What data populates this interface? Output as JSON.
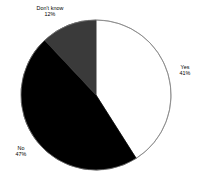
{
  "chart_data": {
    "type": "pie",
    "title": "",
    "subtitle": "",
    "xlabel": "",
    "ylabel": "",
    "legend_position": "none",
    "grid": false,
    "labels_outside": true,
    "start_angle_deg": 0,
    "direction": "clockwise",
    "categories": [
      "Yes",
      "No",
      "Don't know"
    ],
    "values": [
      41,
      47,
      12
    ],
    "unit": "%",
    "slices": [
      {
        "name": "Yes",
        "value": 41,
        "value_label": "41%",
        "color": "#ffffff",
        "stroke": "#808080",
        "start_deg": 0,
        "end_deg": 147.6
      },
      {
        "name": "No",
        "value": 47,
        "value_label": "47%",
        "color": "#000000",
        "stroke": "#000000",
        "start_deg": 147.6,
        "end_deg": 316.8
      },
      {
        "name": "Don't know",
        "value": 12,
        "value_label": "12%",
        "color": "#3a3a3a",
        "stroke": "#3a3a3a",
        "start_deg": 316.8,
        "end_deg": 360
      }
    ]
  },
  "labels": {
    "dont_know": {
      "name": "Don't know",
      "value": "12%"
    },
    "yes": {
      "name": "Yes",
      "value": "41%"
    },
    "no": {
      "name": "No",
      "value": "47%"
    }
  },
  "colors": {
    "background": "#ffffff",
    "yes_slice": "#ffffff",
    "no_slice": "#000000",
    "dont_know_slice": "#3a3a3a",
    "outline": "#808080",
    "text": "#000000"
  },
  "geometry": {
    "center_x": 96,
    "center_y": 95,
    "radius": 75
  }
}
